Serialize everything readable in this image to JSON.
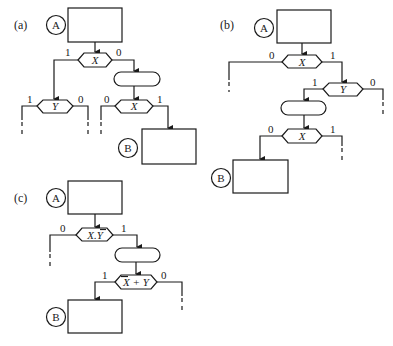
{
  "panels": {
    "a": {
      "label": "(a)",
      "start_node": "A",
      "end_node": "B",
      "decisions": [
        {
          "id": "a1",
          "condition": "X",
          "left_label": "1",
          "right_label": "0"
        },
        {
          "id": "a2",
          "condition": "Y",
          "left_label": "1",
          "right_label": "0"
        },
        {
          "id": "a3",
          "condition": "X",
          "left_label": "0",
          "right_label": "1"
        }
      ]
    },
    "b": {
      "label": "(b)",
      "start_node": "A",
      "end_node": "B",
      "decisions": [
        {
          "id": "b1",
          "condition": "X",
          "left_label": "0",
          "right_label": "1"
        },
        {
          "id": "b2",
          "condition": "Y",
          "left_label": "1",
          "right_label": "0"
        },
        {
          "id": "b3",
          "condition": "X",
          "left_label": "0",
          "right_label": "1"
        }
      ]
    },
    "c": {
      "label": "(c)",
      "start_node": "A",
      "end_node": "B",
      "decisions": [
        {
          "id": "c1",
          "condition": "X.Y",
          "condition_overbar": "Y",
          "left_label": "0",
          "right_label": "1"
        },
        {
          "id": "c2",
          "condition": "X + Y",
          "condition_overbar": "X",
          "left_label": "1",
          "right_label": "0"
        }
      ]
    }
  },
  "colors": {
    "line": "#1a1a1a",
    "background": "#ffffff"
  }
}
